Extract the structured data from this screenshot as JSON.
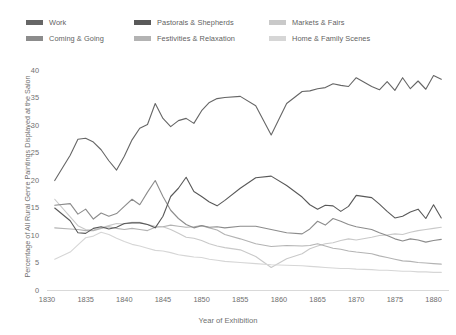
{
  "chart_data": {
    "type": "line",
    "title": "",
    "xlabel": "Year of Exhibition",
    "ylabel": "Percentage of All Rural Genre Paintings Displayed at the Salon",
    "xlim": [
      1830,
      1882
    ],
    "ylim": [
      0,
      40
    ],
    "xticks": [
      1830,
      1835,
      1840,
      1845,
      1850,
      1855,
      1860,
      1865,
      1870,
      1875,
      1880
    ],
    "yticks": [
      0,
      5,
      10,
      15,
      20,
      25,
      30,
      35,
      40
    ],
    "grid": false,
    "legend_position": "top",
    "x": [
      1831,
      1833,
      1834,
      1835,
      1836,
      1837,
      1838,
      1839,
      1840,
      1841,
      1842,
      1843,
      1844,
      1845,
      1846,
      1847,
      1848,
      1849,
      1850,
      1851,
      1852,
      1853,
      1855,
      1857,
      1859,
      1861,
      1863,
      1864,
      1865,
      1866,
      1867,
      1868,
      1869,
      1870,
      1872,
      1873,
      1874,
      1875,
      1876,
      1877,
      1878,
      1879,
      1880,
      1881
    ],
    "series": [
      {
        "name": "Work",
        "color": "#666666",
        "values": [
          19.9,
          24.5,
          27.4,
          27.6,
          26.9,
          25.5,
          23.5,
          21.8,
          24.3,
          27.3,
          29.4,
          30.1,
          33.9,
          31.2,
          29.7,
          30.8,
          31.2,
          30.3,
          32.6,
          34.1,
          34.8,
          35.0,
          35.2,
          33.5,
          28.2,
          33.9,
          36.1,
          36.2,
          36.6,
          36.8,
          37.5,
          37.2,
          37.0,
          38.6,
          37.0,
          36.4,
          37.9,
          36.3,
          38.6,
          36.6,
          38.0,
          36.5,
          39.0,
          38.3
        ]
      },
      {
        "name": "Pastorals & Shepherds",
        "color": "#595959",
        "values": [
          14.9,
          12.6,
          10.4,
          10.3,
          11.2,
          11.5,
          11.1,
          11.4,
          12.1,
          12.2,
          12.2,
          11.9,
          11.3,
          13.4,
          17.0,
          18.5,
          20.5,
          17.9,
          17.0,
          16.0,
          15.3,
          16.3,
          18.5,
          20.4,
          20.7,
          19.0,
          16.9,
          15.5,
          14.7,
          15.4,
          15.3,
          14.3,
          15.2,
          17.2,
          16.8,
          15.6,
          14.3,
          13.1,
          13.4,
          14.2,
          14.7,
          13.0,
          15.5,
          13.1
        ]
      },
      {
        "name": "Markets & Fairs",
        "color": "#c9c9c9",
        "values": [
          16.5,
          13.3,
          11.7,
          11.0,
          10.9,
          11.3,
          11.7,
          12.1,
          12.0,
          12.3,
          12.3,
          11.9,
          11.6,
          11.5,
          11.0,
          10.3,
          9.6,
          9.4,
          9.0,
          8.4,
          8.0,
          7.7,
          7.3,
          6.1,
          4.1,
          5.7,
          6.6,
          7.5,
          8.0,
          8.4,
          8.6,
          9.0,
          9.3,
          9.1,
          9.6,
          9.9,
          10.0,
          10.2,
          10.1,
          10.5,
          10.8,
          11.0,
          11.2,
          11.4
        ]
      },
      {
        "name": "Coming & Going",
        "color": "#8c8c8c",
        "values": [
          15.4,
          15.7,
          13.8,
          14.7,
          12.9,
          14.0,
          13.4,
          13.9,
          15.2,
          16.5,
          15.5,
          17.8,
          19.9,
          17.0,
          14.5,
          13.0,
          11.9,
          11.3,
          11.7,
          11.4,
          11.5,
          11.3,
          11.6,
          11.6,
          11.0,
          10.4,
          10.2,
          11.1,
          12.5,
          11.8,
          13.0,
          12.5,
          11.9,
          11.5,
          11.0,
          10.4,
          9.9,
          9.3,
          8.9,
          9.3,
          9.1,
          8.7,
          9.0,
          9.2
        ]
      },
      {
        "name": "Festivities & Relaxation",
        "color": "#b3b3b3",
        "values": [
          11.3,
          11.1,
          11.0,
          10.8,
          10.8,
          11.2,
          11.5,
          11.2,
          11.0,
          11.2,
          11.0,
          10.8,
          11.4,
          11.5,
          11.8,
          11.6,
          11.4,
          11.5,
          11.7,
          11.3,
          10.9,
          10.1,
          9.3,
          8.4,
          7.9,
          8.1,
          8.0,
          8.1,
          8.4,
          8.0,
          7.6,
          7.4,
          7.1,
          6.9,
          6.6,
          6.2,
          5.9,
          5.6,
          5.3,
          5.2,
          5.0,
          4.9,
          4.8,
          4.7
        ]
      },
      {
        "name": "Home & Family Scenes",
        "color": "#d6d6d6",
        "values": [
          5.6,
          6.9,
          8.2,
          9.5,
          9.8,
          10.5,
          10.1,
          9.4,
          8.8,
          8.3,
          8.0,
          7.6,
          7.2,
          7.1,
          6.8,
          6.4,
          6.2,
          6.0,
          5.9,
          5.6,
          5.4,
          5.2,
          5.0,
          4.8,
          4.6,
          4.5,
          4.4,
          4.3,
          4.2,
          4.1,
          4.0,
          3.9,
          3.9,
          3.8,
          3.7,
          3.6,
          3.6,
          3.5,
          3.4,
          3.4,
          3.3,
          3.3,
          3.2,
          3.2
        ]
      }
    ]
  },
  "legend": {
    "items": [
      {
        "label": "Work",
        "color": "#666666"
      },
      {
        "label": "Pastorals & Shepherds",
        "color": "#595959"
      },
      {
        "label": "Markets & Fairs",
        "color": "#c9c9c9"
      },
      {
        "label": "Coming & Going",
        "color": "#8c8c8c"
      },
      {
        "label": "Festivities & Relaxation",
        "color": "#b3b3b3"
      },
      {
        "label": "Home & Family Scenes",
        "color": "#d6d6d6"
      }
    ]
  },
  "axes": {
    "y_title": "Percentage of All Rural Genre Paintings Displayed at the Salon",
    "x_title": "Year of Exhibition"
  },
  "colors": {
    "axis": "#d9d9d9",
    "tick_text": "#6f6f6f",
    "background": "#ffffff"
  }
}
